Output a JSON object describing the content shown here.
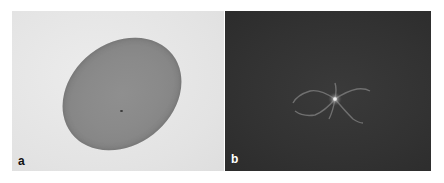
{
  "figure": {
    "panels": [
      {
        "label": "a",
        "description": "Oval cell on light grey background",
        "background_color": "#e6e6e6",
        "object_color": "#8a8a8a"
      },
      {
        "label": "b",
        "description": "Dark field image with faint star-shaped bright structure at center",
        "background_color": "#333333",
        "highlight_color": "#cfcfcf"
      }
    ]
  }
}
